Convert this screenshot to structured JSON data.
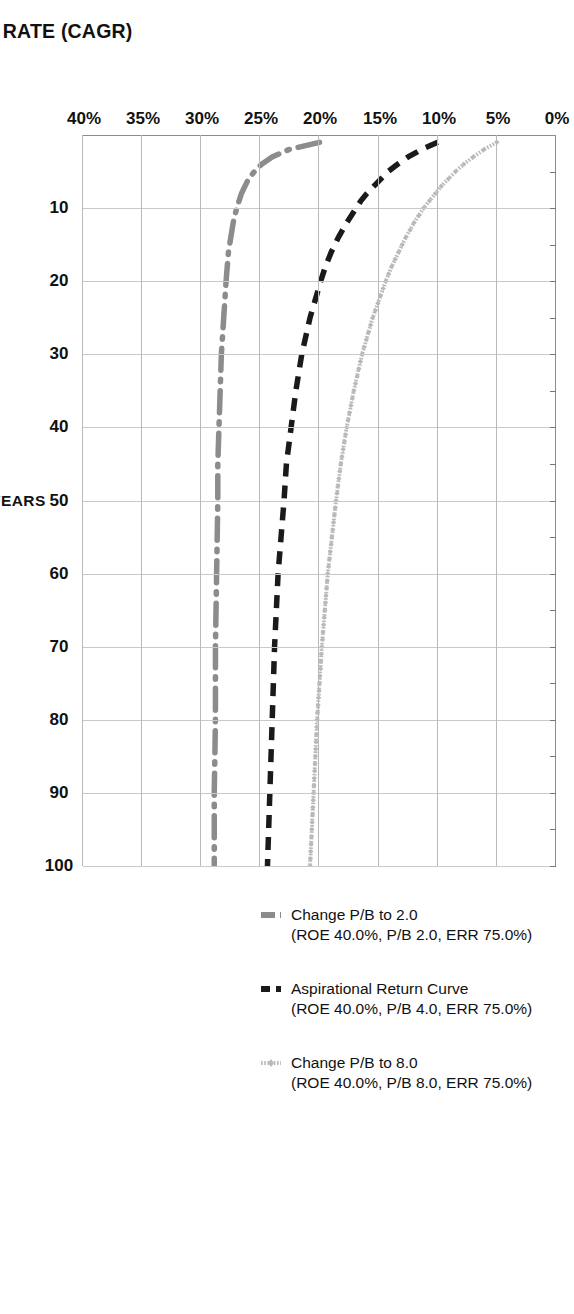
{
  "chart_data": {
    "type": "line",
    "title": "COMPOUND ANNUAL GROWTH RATE (CAGR)",
    "xlabel": "YEARS",
    "ylabel": "COMPOUND ANNUAL GROWTH RATE (CAGR)",
    "orientation": "rotated-90-clockwise",
    "grid": true,
    "legend_position": "bottom",
    "xlim": [
      0,
      100
    ],
    "ylim": [
      0,
      40
    ],
    "x_ticks": [
      0,
      10,
      20,
      30,
      40,
      50,
      60,
      70,
      80,
      90,
      100
    ],
    "x_tick_labels": [
      "",
      "10",
      "20",
      "30",
      "40",
      "50",
      "60",
      "70",
      "80",
      "90",
      "100"
    ],
    "y_ticks": [
      0,
      5,
      10,
      15,
      20,
      25,
      30,
      35,
      40
    ],
    "y_tick_labels": [
      "0%",
      "5%",
      "10%",
      "15%",
      "20%",
      "25%",
      "30%",
      "35%",
      "40%"
    ],
    "x": [
      1,
      2,
      3,
      4,
      5,
      6,
      7,
      8,
      9,
      10,
      12,
      14,
      16,
      18,
      20,
      25,
      30,
      35,
      40,
      45,
      50,
      60,
      70,
      80,
      90,
      100
    ],
    "series": [
      {
        "name": "Change P/B to 8.0",
        "detail": "(ROE 40.0%, P/B 8.0, ERR 75.0%)",
        "label_line1": "Change P/B to 8.0",
        "label_line2": "(ROE 40.0%, P/B 8.0, ERR 75.0%)",
        "color": "#b9b9b9",
        "style": "dotted-diamond-markers",
        "values": [
          5.0,
          6.1,
          7.0,
          7.8,
          8.5,
          9.1,
          9.7,
          10.2,
          10.7,
          11.2,
          12.0,
          12.7,
          13.3,
          13.9,
          14.4,
          15.5,
          16.4,
          17.1,
          17.7,
          18.2,
          18.6,
          19.3,
          19.8,
          20.2,
          20.5,
          20.8
        ]
      },
      {
        "name": "Aspirational Return Curve",
        "detail": "(ROE 40.0%, P/B 4.0, ERR 75.0%)",
        "label_line1": "Aspirational Return Curve",
        "label_line2": "(ROE 40.0%, P/B 4.0, ERR 75.0%)",
        "color": "#1a1a1a",
        "style": "dashed",
        "values": [
          10.0,
          11.4,
          12.5,
          13.4,
          14.2,
          14.8,
          15.4,
          16.0,
          16.5,
          16.9,
          17.7,
          18.4,
          19.0,
          19.5,
          19.9,
          20.8,
          21.5,
          22.0,
          22.4,
          22.8,
          23.0,
          23.5,
          23.8,
          24.0,
          24.2,
          24.4
        ]
      },
      {
        "name": "Change P/B to 2.0",
        "detail": "(ROE 40.0%, P/B 2.0, ERR 75.0%)",
        "label_line1": "Change P/B to 2.0",
        "label_line2": "(ROE 40.0%, P/B 2.0, ERR 75.0%)",
        "color": "#8c8c8c",
        "style": "dash-dot",
        "values": [
          20.0,
          22.6,
          24.0,
          24.9,
          25.5,
          26.0,
          26.3,
          26.6,
          26.8,
          27.0,
          27.3,
          27.5,
          27.7,
          27.8,
          27.9,
          28.1,
          28.3,
          28.4,
          28.5,
          28.6,
          28.6,
          28.7,
          28.8,
          28.8,
          28.9,
          28.9
        ]
      }
    ]
  },
  "legend": [
    {
      "line1": "Change P/B to 2.0",
      "line2": "(ROE 40.0%, P/B 2.0, ERR 75.0%)",
      "color": "#8c8c8c"
    },
    {
      "line1": "Aspirational Return Curve",
      "line2": "(ROE 40.0%, P/B 4.0, ERR 75.0%)",
      "color": "#1a1a1a"
    },
    {
      "line1": "Change P/B to 8.0",
      "line2": "(ROE 40.0%, P/B 8.0, ERR 75.0%)",
      "color": "#b9b9b9"
    }
  ]
}
